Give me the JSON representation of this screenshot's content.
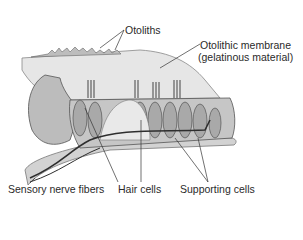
{
  "diagram": {
    "labels": {
      "otoliths": "Otoliths",
      "membrane_line1": "Otolithic membrane",
      "membrane_line2": "(gelatinous material)",
      "nerve": "Sensory nerve fibers",
      "hair_cells": "Hair cells",
      "supporting_cells": "Supporting cells"
    },
    "colors": {
      "membrane": "#e4e4e4",
      "cells": "#b8b8b8",
      "cell_outline": "#555555",
      "nerve": "#2e2e2e",
      "base": "#cfcfcf",
      "leader": "#333333"
    }
  }
}
